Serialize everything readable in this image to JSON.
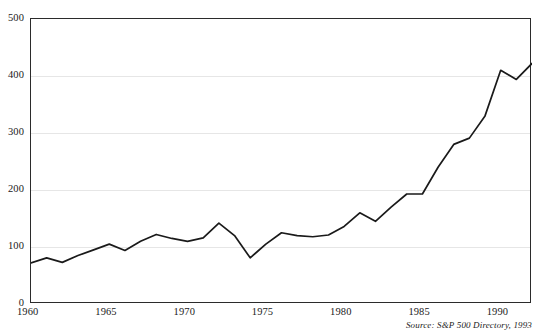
{
  "chart_data": {
    "type": "line",
    "title": "",
    "subtitle": "",
    "xlabel": "",
    "ylabel": "",
    "xlim": [
      1960,
      1992
    ],
    "ylim": [
      0,
      500
    ],
    "grid": true,
    "grid_axis": "y",
    "legend": "none",
    "line_color": "#1a1a1a",
    "x_tick_labels": [
      "1960",
      "1965",
      "1970",
      "1975",
      "1980",
      "1985",
      "1990"
    ],
    "x_ticks": [
      1960,
      1965,
      1970,
      1975,
      1980,
      1985,
      1990
    ],
    "y_tick_labels": [
      "0",
      "100",
      "200",
      "300",
      "400",
      "500"
    ],
    "y_ticks": [
      0,
      100,
      200,
      300,
      400,
      500
    ],
    "x": [
      1960,
      1961,
      1962,
      1963,
      1964,
      1965,
      1966,
      1967,
      1968,
      1969,
      1970,
      1971,
      1972,
      1973,
      1974,
      1975,
      1976,
      1977,
      1978,
      1979,
      1980,
      1981,
      1982,
      1983,
      1984,
      1985,
      1986,
      1987,
      1988,
      1989,
      1990,
      1991,
      1992
    ],
    "values": [
      72,
      81,
      73,
      85,
      95,
      105,
      94,
      110,
      122,
      115,
      110,
      116,
      142,
      120,
      81,
      105,
      125,
      120,
      118,
      121,
      136,
      160,
      145,
      170,
      193,
      193,
      240,
      280,
      291,
      330,
      410,
      394,
      422
    ],
    "series": [
      {
        "name": "S&P 500 Index",
        "values": [
          72,
          81,
          73,
          85,
          95,
          105,
          94,
          110,
          122,
          115,
          110,
          116,
          142,
          120,
          81,
          105,
          125,
          120,
          118,
          121,
          136,
          160,
          145,
          170,
          193,
          193,
          240,
          280,
          291,
          330,
          410,
          394,
          422
        ]
      }
    ],
    "annotations": [
      {
        "name": "source",
        "text": "Source: S&P 500 Directory, 1993"
      }
    ]
  },
  "source": {
    "text": "Source: S&P 500 Directory, 1993"
  }
}
